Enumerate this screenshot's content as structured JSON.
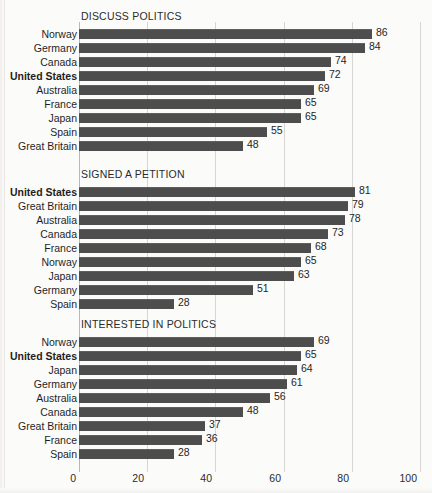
{
  "chart_data": {
    "type": "bar",
    "title": "",
    "orientation": "horizontal",
    "xlabel": "",
    "ylabel": "",
    "xlim": [
      0,
      100
    ],
    "xticks": [
      0,
      20,
      40,
      60,
      80,
      100
    ],
    "xtick_labels": [
      "0",
      "20",
      "40",
      "60",
      "80",
      "100"
    ],
    "grid": true,
    "legend": null,
    "bar_color": "#4d4d4d",
    "highlight_category": "United States",
    "panels": [
      {
        "title": "DISCUSS POLITICS",
        "categories": [
          "Norway",
          "Germany",
          "Canada",
          "United States",
          "Australia",
          "France",
          "Japan",
          "Spain",
          "Great Britain"
        ],
        "values": [
          86,
          84,
          74,
          72,
          69,
          65,
          65,
          55,
          48
        ]
      },
      {
        "title": "SIGNED A PETITION",
        "categories": [
          "United States",
          "Great Britain",
          "Australia",
          "Canada",
          "France",
          "Norway",
          "Japan",
          "Germany",
          "Spain"
        ],
        "values": [
          81,
          79,
          78,
          73,
          68,
          65,
          63,
          51,
          28
        ]
      },
      {
        "title": "INTERESTED IN POLITICS",
        "categories": [
          "Norway",
          "United States",
          "Japan",
          "Germany",
          "Australia",
          "Canada",
          "Great Britain",
          "France",
          "Spain"
        ],
        "values": [
          69,
          65,
          64,
          61,
          56,
          48,
          37,
          36,
          28
        ]
      }
    ]
  }
}
